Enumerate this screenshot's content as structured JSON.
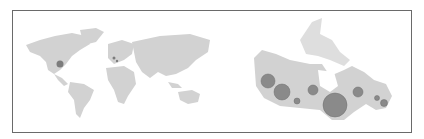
{
  "figure": {
    "frame_color": "#6a6a6a",
    "land_color": "#cfcfcf",
    "land_dark": "#bdbdbd",
    "bubble_color": "#8a8a8a",
    "bubble_stroke": "#6e6e6e"
  },
  "world_map": {
    "bubbles": [
      {
        "id": "north-america",
        "cx": 60,
        "cy": 64,
        "r": 3.5
      },
      {
        "id": "europe",
        "cx": 114,
        "cy": 58,
        "r": 1.5
      },
      {
        "id": "europe-2",
        "cx": 117,
        "cy": 61,
        "r": 1.2
      }
    ]
  },
  "canada_map": {
    "bubbles": [
      {
        "id": "bubble-bc-north",
        "cx": 268,
        "cy": 81,
        "r": 7
      },
      {
        "id": "bubble-alberta",
        "cx": 282,
        "cy": 92,
        "r": 8
      },
      {
        "id": "bubble-sask-south",
        "cx": 297,
        "cy": 101,
        "r": 3
      },
      {
        "id": "bubble-manitoba",
        "cx": 313,
        "cy": 90,
        "r": 5
      },
      {
        "id": "bubble-ontario",
        "cx": 335,
        "cy": 105,
        "r": 12
      },
      {
        "id": "bubble-quebec",
        "cx": 358,
        "cy": 92,
        "r": 5
      },
      {
        "id": "bubble-nb",
        "cx": 377,
        "cy": 98,
        "r": 2.5
      },
      {
        "id": "bubble-ns",
        "cx": 384,
        "cy": 103,
        "r": 3.5
      }
    ]
  }
}
